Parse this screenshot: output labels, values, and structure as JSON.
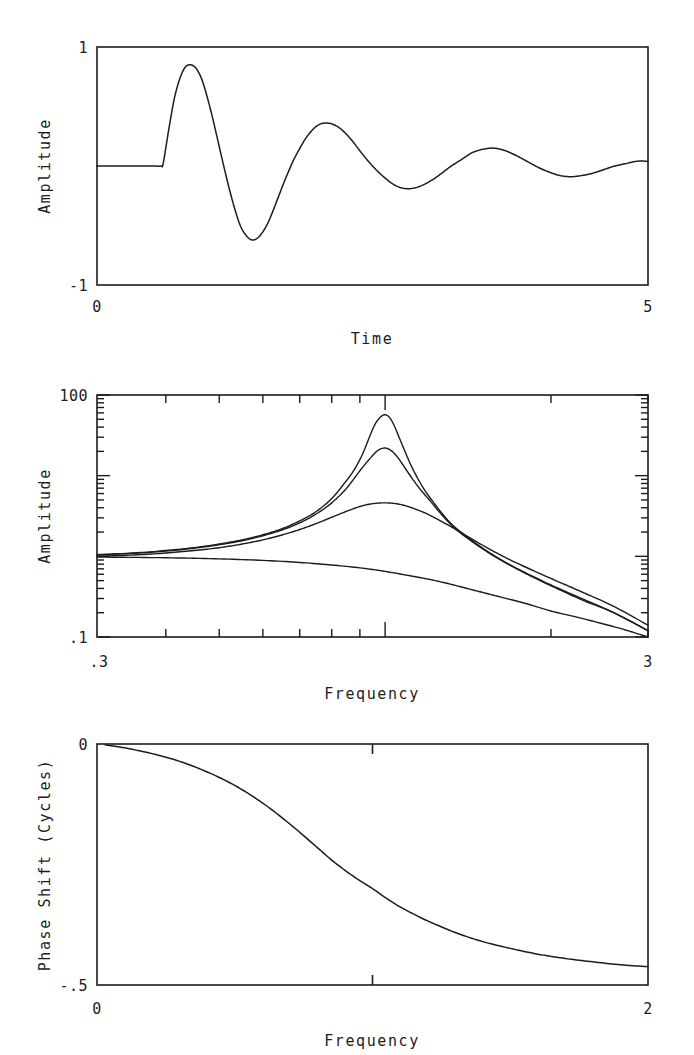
{
  "figure": {
    "background": "#ffffff",
    "line_color": "#1c1c1c",
    "axis_color": "#1c1c1c"
  },
  "panels": [
    {
      "id": "impulse-response",
      "ylabel": "Amplitude",
      "xlabel": "Time",
      "y_ticks": [
        "1",
        "-1"
      ],
      "x_ticks": [
        "0",
        "5"
      ]
    },
    {
      "id": "amplitude-response",
      "ylabel": "Amplitude",
      "xlabel": "Frequency",
      "y_ticks": [
        "100",
        ".1"
      ],
      "x_ticks": [
        ".3",
        "3"
      ]
    },
    {
      "id": "phase-response",
      "ylabel": "Phase Shift (Cycles)",
      "xlabel": "Frequency",
      "y_ticks": [
        "0",
        "-.5"
      ],
      "x_ticks": [
        "0",
        "2"
      ]
    }
  ],
  "chart_data": [
    {
      "type": "line",
      "id": "impulse-response",
      "title": "",
      "xlabel": "Time",
      "ylabel": "Amplitude",
      "xlim": [
        0,
        5
      ],
      "ylim": [
        -1,
        1
      ],
      "xscale": "linear",
      "yscale": "linear",
      "grid": false,
      "legend": "none",
      "xtick_labels": [
        "0",
        "5"
      ],
      "ytick_labels": [
        "1",
        "-1"
      ],
      "description": "Damped sinusoidal impulse response; flat at zero until t=0.6, then exponentially decaying oscillation with period about 0.95",
      "series": [
        {
          "name": "impulse response",
          "x": [
            0.0,
            0.1,
            0.2,
            0.3,
            0.4,
            0.5,
            0.58,
            0.6,
            0.65,
            0.7,
            0.75,
            0.8,
            0.85,
            0.9,
            0.95,
            1.0,
            1.05,
            1.1,
            1.15,
            1.2,
            1.25,
            1.3,
            1.35,
            1.4,
            1.45,
            1.5,
            1.55,
            1.6,
            1.65,
            1.7,
            1.75,
            1.8,
            1.9,
            2.0,
            2.1,
            2.2,
            2.3,
            2.4,
            2.5,
            2.6,
            2.7,
            2.8,
            2.9,
            3.0,
            3.1,
            3.2,
            3.3,
            3.4,
            3.5,
            3.6,
            3.7,
            3.8,
            3.9,
            4.0,
            4.1,
            4.2,
            4.3,
            4.4,
            4.5,
            4.6,
            4.7,
            4.8,
            4.9,
            5.0
          ],
          "y": [
            0.0,
            0.0,
            0.0,
            0.0,
            0.0,
            0.0,
            0.0,
            0.02,
            0.3,
            0.56,
            0.73,
            0.83,
            0.85,
            0.82,
            0.73,
            0.58,
            0.4,
            0.2,
            0.0,
            -0.19,
            -0.36,
            -0.5,
            -0.58,
            -0.62,
            -0.61,
            -0.56,
            -0.48,
            -0.37,
            -0.25,
            -0.13,
            -0.02,
            0.08,
            0.24,
            0.34,
            0.36,
            0.32,
            0.23,
            0.11,
            0.0,
            -0.09,
            -0.16,
            -0.19,
            -0.18,
            -0.14,
            -0.08,
            -0.01,
            0.05,
            0.11,
            0.14,
            0.15,
            0.13,
            0.09,
            0.04,
            -0.01,
            -0.05,
            -0.08,
            -0.09,
            -0.08,
            -0.06,
            -0.03,
            0.0,
            0.02,
            0.04,
            0.04
          ]
        }
      ]
    },
    {
      "type": "line",
      "id": "amplitude-response",
      "title": "",
      "xlabel": "Frequency",
      "ylabel": "Amplitude",
      "xlim": [
        0.3,
        3
      ],
      "ylim": [
        0.1,
        100
      ],
      "xscale": "log",
      "yscale": "log",
      "grid": false,
      "legend": "none",
      "xtick_labels": [
        ".3",
        "3"
      ],
      "ytick_labels": [
        "100",
        ".1"
      ],
      "resonance_frequency": 1.0,
      "description": "Four resonance amplitude curves of differing damping on log-log axes; all start near 1.0 at f=0.3 and converge near 0.1 at f=3",
      "series": [
        {
          "name": "Q high (sharp resonance)",
          "peak": 57,
          "x": [
            0.3,
            0.35,
            0.4,
            0.45,
            0.5,
            0.55,
            0.6,
            0.65,
            0.7,
            0.75,
            0.8,
            0.85,
            0.88,
            0.91,
            0.94,
            0.96,
            0.98,
            1.0,
            1.02,
            1.04,
            1.06,
            1.09,
            1.12,
            1.16,
            1.2,
            1.3,
            1.4,
            1.55,
            1.7,
            1.9,
            2.1,
            2.3,
            2.6,
            3.0
          ],
          "y": [
            1.05,
            1.1,
            1.18,
            1.28,
            1.42,
            1.6,
            1.85,
            2.2,
            2.75,
            3.6,
            5.2,
            8.6,
            12.0,
            18.5,
            32.0,
            44.0,
            53.0,
            57.0,
            52.0,
            41.0,
            30.0,
            19.0,
            12.5,
            8.0,
            5.6,
            2.8,
            1.8,
            1.1,
            0.76,
            0.52,
            0.38,
            0.29,
            0.2,
            0.12
          ]
        },
        {
          "name": "Q medium-high",
          "peak": 22,
          "x": [
            0.3,
            0.35,
            0.4,
            0.45,
            0.5,
            0.55,
            0.6,
            0.65,
            0.7,
            0.75,
            0.8,
            0.85,
            0.9,
            0.94,
            0.97,
            1.0,
            1.03,
            1.06,
            1.1,
            1.15,
            1.2,
            1.3,
            1.4,
            1.55,
            1.7,
            1.9,
            2.1,
            2.3,
            2.6,
            3.0
          ],
          "y": [
            1.04,
            1.09,
            1.16,
            1.26,
            1.39,
            1.56,
            1.8,
            2.12,
            2.6,
            3.35,
            4.6,
            6.9,
            11.5,
            16.5,
            20.5,
            22.0,
            20.0,
            16.0,
            11.0,
            7.2,
            5.1,
            2.7,
            1.74,
            1.08,
            0.75,
            0.51,
            0.37,
            0.28,
            0.2,
            0.12
          ]
        },
        {
          "name": "Q low (broad resonance)",
          "peak": 4.6,
          "x": [
            0.3,
            0.35,
            0.4,
            0.45,
            0.5,
            0.55,
            0.6,
            0.65,
            0.7,
            0.75,
            0.8,
            0.85,
            0.9,
            0.95,
            1.0,
            1.05,
            1.1,
            1.15,
            1.2,
            1.3,
            1.4,
            1.55,
            1.7,
            1.9,
            2.1,
            2.3,
            2.6,
            3.0
          ],
          "y": [
            1.0,
            1.04,
            1.1,
            1.18,
            1.28,
            1.42,
            1.6,
            1.84,
            2.15,
            2.55,
            3.05,
            3.6,
            4.15,
            4.5,
            4.6,
            4.48,
            4.15,
            3.72,
            3.28,
            2.45,
            1.82,
            1.22,
            0.88,
            0.62,
            0.46,
            0.35,
            0.24,
            0.14
          ]
        },
        {
          "name": "overdamped (no resonance)",
          "peak": 1.0,
          "x": [
            0.3,
            0.4,
            0.5,
            0.6,
            0.7,
            0.8,
            0.9,
            1.0,
            1.1,
            1.2,
            1.3,
            1.45,
            1.6,
            1.8,
            2.0,
            2.2,
            2.4,
            2.7,
            3.0
          ],
          "y": [
            0.98,
            0.96,
            0.93,
            0.89,
            0.84,
            0.78,
            0.72,
            0.65,
            0.58,
            0.52,
            0.46,
            0.38,
            0.32,
            0.26,
            0.21,
            0.18,
            0.155,
            0.125,
            0.1
          ]
        }
      ]
    },
    {
      "type": "line",
      "id": "phase-response",
      "title": "",
      "xlabel": "Frequency",
      "ylabel": "Phase Shift (Cycles)",
      "xlim": [
        0,
        2
      ],
      "ylim": [
        -0.5,
        0
      ],
      "xscale": "linear",
      "yscale": "linear",
      "grid": false,
      "legend": "none",
      "xtick_labels": [
        "0",
        "2"
      ],
      "ytick_labels": [
        "0",
        "-.5"
      ],
      "description": "Phase shift falling from 0 cycles at low frequency through -0.25 at f=1 toward -0.5 cycles at f=2",
      "series": [
        {
          "name": "phase shift",
          "x": [
            0.03,
            0.1,
            0.2,
            0.3,
            0.4,
            0.5,
            0.6,
            0.7,
            0.8,
            0.85,
            0.9,
            0.95,
            1.0,
            1.05,
            1.1,
            1.15,
            1.2,
            1.3,
            1.4,
            1.5,
            1.6,
            1.7,
            1.8,
            1.9,
            2.0
          ],
          "y": [
            -0.002,
            -0.008,
            -0.02,
            -0.036,
            -0.058,
            -0.086,
            -0.122,
            -0.166,
            -0.215,
            -0.24,
            -0.262,
            -0.282,
            -0.3,
            -0.32,
            -0.338,
            -0.353,
            -0.367,
            -0.391,
            -0.41,
            -0.424,
            -0.436,
            -0.445,
            -0.452,
            -0.458,
            -0.462
          ]
        }
      ]
    }
  ]
}
